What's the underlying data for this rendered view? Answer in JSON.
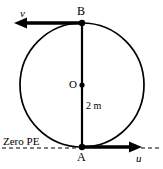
{
  "figure": {
    "title_alt": "vertical circle with points A and B, velocities u and v, zero PE line",
    "colors": {
      "stroke": "#000000",
      "background": "#ffffff"
    },
    "labels": {
      "velocity_top": "v",
      "velocity_bottom": "u",
      "point_top": "B",
      "point_bottom": "A",
      "center": "O",
      "diameter": "2 m",
      "reference_line": "Zero PE"
    },
    "geometry": {
      "circle_center_x": 82,
      "circle_center_y": 85,
      "circle_radius": 62,
      "point_B_x": 82,
      "point_B_y": 23,
      "point_A_x": 82,
      "point_A_y": 147,
      "arrow_v_tip_x": 15,
      "arrow_v_y": 23,
      "arrow_u_tip_x": 141,
      "arrow_u_y": 147,
      "zero_pe_line_y": 148
    }
  }
}
